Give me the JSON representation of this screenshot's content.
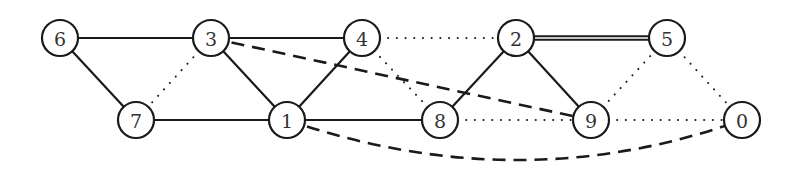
{
  "diagram": {
    "type": "graph",
    "colors": {
      "stroke": "#1a1a1a",
      "node_fill": "#ffffff",
      "label": "#333333",
      "background": "#ffffff"
    },
    "node_radius": 18,
    "nodes": [
      {
        "id": "6",
        "label": "6",
        "x": 60,
        "y": 38
      },
      {
        "id": "3",
        "label": "3",
        "x": 211,
        "y": 38
      },
      {
        "id": "4",
        "label": "4",
        "x": 362,
        "y": 38
      },
      {
        "id": "2",
        "label": "2",
        "x": 516,
        "y": 38
      },
      {
        "id": "5",
        "label": "5",
        "x": 667,
        "y": 38
      },
      {
        "id": "7",
        "label": "7",
        "x": 136,
        "y": 120
      },
      {
        "id": "1",
        "label": "1",
        "x": 287,
        "y": 120
      },
      {
        "id": "8",
        "label": "8",
        "x": 440,
        "y": 120
      },
      {
        "id": "9",
        "label": "9",
        "x": 591,
        "y": 120
      },
      {
        "id": "0",
        "label": "0",
        "x": 742,
        "y": 120
      }
    ],
    "edges": [
      {
        "from": "6",
        "to": "3",
        "style": "solid"
      },
      {
        "from": "3",
        "to": "4",
        "style": "solid"
      },
      {
        "from": "6",
        "to": "7",
        "style": "solid"
      },
      {
        "from": "7",
        "to": "1",
        "style": "solid"
      },
      {
        "from": "3",
        "to": "1",
        "style": "solid"
      },
      {
        "from": "1",
        "to": "4",
        "style": "solid"
      },
      {
        "from": "1",
        "to": "8",
        "style": "solid"
      },
      {
        "from": "8",
        "to": "2",
        "style": "solid"
      },
      {
        "from": "2",
        "to": "9",
        "style": "solid"
      },
      {
        "from": "2",
        "to": "5",
        "style": "double"
      },
      {
        "from": "3",
        "to": "7",
        "style": "dotted"
      },
      {
        "from": "4",
        "to": "2",
        "style": "dotted"
      },
      {
        "from": "4",
        "to": "8",
        "style": "dotted"
      },
      {
        "from": "8",
        "to": "9",
        "style": "dotted"
      },
      {
        "from": "9",
        "to": "0",
        "style": "dotted"
      },
      {
        "from": "9",
        "to": "5",
        "style": "dotted"
      },
      {
        "from": "5",
        "to": "0",
        "style": "dotted"
      },
      {
        "from": "3",
        "to": "9",
        "style": "dashed"
      },
      {
        "from": "1",
        "to": "0",
        "style": "dashed",
        "curved": true,
        "control": [
          520,
          200
        ]
      }
    ]
  }
}
